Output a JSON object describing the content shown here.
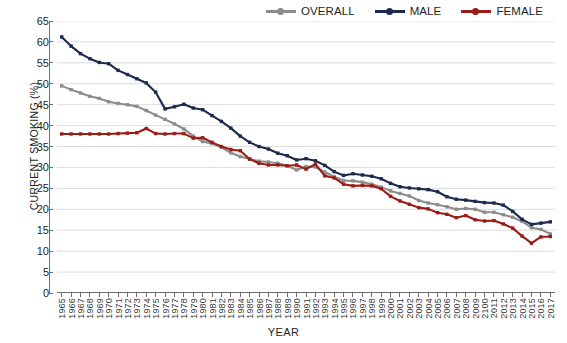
{
  "chart_data": {
    "type": "line",
    "title": "",
    "xlabel": "YEAR",
    "ylabel": "CURRENT SMOKING (%)",
    "ylim": [
      0,
      65
    ],
    "ytick_step": 5,
    "yticks": [
      0,
      5,
      10,
      15,
      20,
      25,
      30,
      35,
      40,
      45,
      50,
      55,
      60,
      65
    ],
    "grid": "horizontal",
    "legend_position": "top-right",
    "categories": [
      "1965",
      "1966",
      "1967",
      "1968",
      "1969",
      "1970",
      "1971",
      "1972",
      "1973",
      "1974",
      "1975",
      "1976",
      "1977",
      "1978",
      "1979",
      "1980",
      "1981",
      "1982",
      "1983",
      "1984",
      "1985",
      "1986",
      "1987",
      "1988",
      "1989",
      "1990",
      "1991",
      "1992",
      "1993",
      "1994",
      "1995",
      "1996",
      "1997",
      "1998",
      "1999",
      "2000",
      "2001",
      "2002",
      "2003",
      "2004",
      "2005",
      "2006",
      "2007",
      "2008",
      "2009",
      "2100",
      "2011",
      "2012",
      "2013",
      "2014",
      "2015",
      "2016",
      "2017"
    ],
    "series": [
      {
        "name": "OVERALL",
        "color": "#8c8c8c",
        "values": [
          49.5,
          48.6,
          47.8,
          47.0,
          46.5,
          45.7,
          45.3,
          45.0,
          44.6,
          43.6,
          42.5,
          41.5,
          40.4,
          39.2,
          37.5,
          36.2,
          35.7,
          34.8,
          33.5,
          32.6,
          32.0,
          31.5,
          31.3,
          31.0,
          30.4,
          29.4,
          30.2,
          30.1,
          28.9,
          27.8,
          26.9,
          26.8,
          26.5,
          26.0,
          25.3,
          24.4,
          23.8,
          23.2,
          22.1,
          21.5,
          21.1,
          20.6,
          20.0,
          20.2,
          20.0,
          19.3,
          19.3,
          18.7,
          18.1,
          17.1,
          15.6,
          15.2,
          14.1
        ]
      },
      {
        "name": "MALE",
        "color": "#1b2a4e",
        "values": [
          61.2,
          59.0,
          57.2,
          56.0,
          55.1,
          54.8,
          53.2,
          52.2,
          51.2,
          50.2,
          48.0,
          44.0,
          44.5,
          45.1,
          44.2,
          43.8,
          42.4,
          41.0,
          39.4,
          37.5,
          36.0,
          35.0,
          34.4,
          33.4,
          32.8,
          31.8,
          32.1,
          31.6,
          30.5,
          29.0,
          28.1,
          28.5,
          28.2,
          27.9,
          27.3,
          26.2,
          25.4,
          25.1,
          24.9,
          24.7,
          24.2,
          23.0,
          22.4,
          22.2,
          21.9,
          21.6,
          21.5,
          21.0,
          19.5,
          17.6,
          16.4,
          16.7,
          17.0
        ]
      },
      {
        "name": "FEMALE",
        "color": "#9b1b15",
        "values": [
          38.0,
          38.0,
          38.0,
          38.0,
          38.0,
          38.0,
          38.1,
          38.2,
          38.3,
          39.3,
          38.1,
          38.0,
          38.1,
          38.1,
          37.0,
          37.1,
          36.0,
          35.0,
          34.3,
          34.0,
          32.0,
          31.0,
          30.6,
          30.6,
          30.4,
          30.6,
          29.6,
          30.8,
          28.0,
          27.5,
          26.0,
          25.6,
          25.7,
          25.6,
          24.9,
          23.1,
          22.0,
          21.2,
          20.4,
          20.1,
          19.2,
          18.8,
          18.0,
          18.5,
          17.5,
          17.2,
          17.3,
          16.5,
          15.5,
          13.6,
          11.9,
          13.4,
          13.5
        ]
      }
    ]
  },
  "legend": {
    "items": [
      {
        "label": "OVERALL",
        "color": "#8c8c8c"
      },
      {
        "label": "MALE",
        "color": "#1b2a4e"
      },
      {
        "label": "FEMALE",
        "color": "#9b1b15"
      }
    ]
  },
  "axes": {
    "y_title": "CURRENT SMOKING (%)",
    "x_title": "YEAR"
  },
  "colors": {
    "grid": "#d9d9d9",
    "axis": "#6d6d6d",
    "text": "#231f20",
    "background": "#ffffff"
  }
}
